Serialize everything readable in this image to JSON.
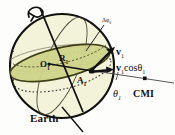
{
  "figure": {
    "caption_label": "Earth",
    "colors": {
      "sphere_fill": "#f2f3d8",
      "plane_fill": "#cfd48a",
      "plane_stroke": "#4a4a20",
      "outline": "#111111",
      "background": "#fdfdfb"
    }
  },
  "labels": {
    "earth": "Earth",
    "cmi": "CMI",
    "center_point": "O",
    "center_point_sub": "1",
    "radius": "R",
    "radius_sub": "1",
    "surface_point": "A",
    "surface_point_sub": "1",
    "velocity": "v",
    "velocity_sub": "1",
    "velocity_projection": "v",
    "velocity_projection_sub": "1",
    "velocity_projection_cos": "cosθ",
    "velocity_projection_cos_sub": "1",
    "angle": "θ",
    "angle_sub": "1",
    "delta_phi": "Δφ",
    "delta_phi_sub": "0"
  },
  "geometry": {
    "sphere_center_x": 62,
    "sphere_center_y": 66,
    "sphere_radius": 52,
    "axis_tilt_degrees": 22,
    "rotation_arrow": "curved-ccw"
  }
}
